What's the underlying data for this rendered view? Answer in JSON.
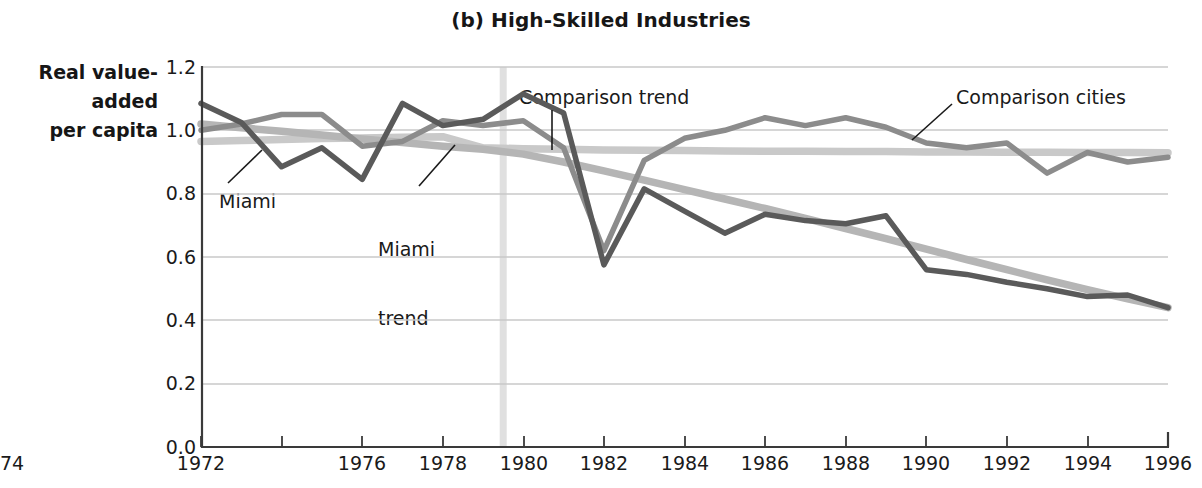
{
  "title": "(b) High-Skilled Industries",
  "axis": {
    "y_title_lines": [
      "Real value-",
      "added",
      "per capita"
    ],
    "y_ticks": [
      "0.0",
      "0.2",
      "0.4",
      "0.6",
      "0.8",
      "1.0",
      "1.2"
    ],
    "x_ticks": [
      "1972",
      "1974",
      "1976",
      "1978",
      "1980",
      "1982",
      "1984",
      "1986",
      "1988",
      "1990",
      "1992",
      "1994",
      "1996"
    ]
  },
  "annotations": {
    "comparison_trend": "Comparison trend",
    "comparison_cities": "Comparison cities",
    "miami": "Miami",
    "miami_trend_line1": "Miami",
    "miami_trend_line2": "trend"
  },
  "colors": {
    "miami": "#5a5a5a",
    "comparison_cities": "#8c8c8c",
    "miami_trend": "#b5b5b5",
    "comparison_trend": "#c9c9c9",
    "axis": "#3a3a3a",
    "grid": "#c9c9c9",
    "event_line": "#e0e0e0",
    "background": "#ffffff"
  },
  "chart_data": {
    "type": "line",
    "title": "(b) High-Skilled Industries",
    "xlabel": "",
    "ylabel": "Real value-added per capita",
    "xlim": [
      1972,
      1996
    ],
    "ylim": [
      0.0,
      1.2
    ],
    "grid": true,
    "legend": "annotated inline",
    "x": [
      1972,
      1973,
      1974,
      1975,
      1976,
      1977,
      1978,
      1979,
      1980,
      1981,
      1982,
      1983,
      1984,
      1985,
      1986,
      1987,
      1988,
      1989,
      1990,
      1991,
      1992,
      1993,
      1994,
      1995,
      1996
    ],
    "series": [
      {
        "name": "Miami",
        "color": "#5a5a5a",
        "values": [
          1.085,
          1.025,
          0.885,
          0.945,
          0.845,
          1.085,
          1.015,
          1.035,
          1.115,
          1.055,
          0.575,
          0.815,
          0.745,
          0.675,
          0.735,
          0.715,
          0.705,
          0.73,
          0.56,
          0.545,
          0.52,
          0.5,
          0.475,
          0.48,
          0.44
        ]
      },
      {
        "name": "Comparison cities",
        "color": "#8c8c8c",
        "values": [
          1.0,
          1.02,
          1.05,
          1.05,
          0.95,
          0.965,
          1.03,
          1.015,
          1.03,
          0.945,
          0.62,
          0.905,
          0.975,
          1.0,
          1.04,
          1.015,
          1.04,
          1.01,
          0.96,
          0.945,
          0.96,
          0.865,
          0.93,
          0.9,
          0.915
        ]
      },
      {
        "name": "Miami trend",
        "color": "#b5b5b5",
        "values": [
          1.02,
          1.008,
          0.997,
          0.985,
          0.973,
          0.962,
          0.95,
          0.94,
          0.925,
          0.9,
          0.872,
          0.843,
          0.813,
          0.783,
          0.753,
          0.722,
          0.69,
          0.658,
          0.625,
          0.592,
          0.56,
          0.528,
          0.497,
          0.468,
          0.44
        ]
      },
      {
        "name": "Comparison trend",
        "color": "#c9c9c9",
        "values": [
          0.965,
          0.968,
          0.971,
          0.974,
          0.976,
          0.978,
          0.98,
          0.945,
          0.942,
          0.94,
          0.938,
          0.937,
          0.936,
          0.935,
          0.934,
          0.934,
          0.933,
          0.933,
          0.932,
          0.932,
          0.931,
          0.931,
          0.93,
          0.93,
          0.929
        ]
      }
    ],
    "event_marker": {
      "x": 1979.5,
      "label": ""
    }
  }
}
